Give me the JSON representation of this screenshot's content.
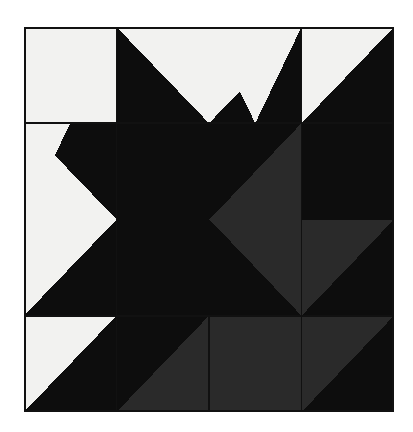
{
  "artwork": {
    "title": "Variable Star Quilt Block",
    "medium": "pieced fabric quilt block photograph",
    "background_color": "#ffffff",
    "block": {
      "x": 24,
      "y": 27,
      "width": 370,
      "height": 385,
      "grid_columns": 4,
      "grid_rows": 4,
      "seam_line_color": "#111111",
      "seam_line_width": 1.6,
      "outer_border_color": "#111111",
      "outer_border_width": 2.2
    },
    "palette": {
      "light": "#f2f2f0",
      "dark": "#0d0d0d",
      "gray": "#2b2b2b",
      "light_name": "cream",
      "dark_name": "black",
      "gray_name": "charcoal"
    },
    "grid_lines": {
      "vertical_x": [
        24,
        102,
        246,
        394
      ],
      "horizontal_y": [
        27,
        106,
        258,
        412
      ]
    },
    "patches": [
      {
        "name": "r1c1-plain-light",
        "points": "0,0 92.5,0 92.5,96.25 0,96.25",
        "fill": "light"
      },
      {
        "name": "r1c2-geese-dark-left",
        "points": "92.5,0 185,0 138.75,96.25 92.5,96.25",
        "fill": "dark"
      },
      {
        "name": "r1c2-geese-light-center",
        "points": "92.5,0 277.5,0 185,96.25 92.5,0",
        "fill": "light"
      },
      {
        "name": "r1c2c3-geese-light-triangle",
        "points": "92.5,0 277.5,0 185,96.25",
        "fill": "light"
      },
      {
        "name": "r1c3-geese-dark-right",
        "points": "277.5,0 277.5,96.25 231.25,96.25",
        "fill": "dark"
      },
      {
        "name": "r1c2-dark-fill-left",
        "points": "92.5,0 92.5,96.25 138.75,96.25",
        "fill": "dark"
      },
      {
        "name": "r1c3-light-square-left",
        "points": "185,0 277.5,0 277.5,96.25 231.25,96.25",
        "fill": "light"
      },
      {
        "name": "r1c4-hst-light",
        "points": "277.5,0 370,0 277.5,96.25",
        "fill": "light"
      },
      {
        "name": "r1c4-hst-dark",
        "points": "370,0 370,96.25 277.5,96.25",
        "fill": "dark"
      },
      {
        "name": "r2c1-point-light-upper",
        "points": "0,96.25 46.25,96.25 0,192.5",
        "fill": "light"
      },
      {
        "name": "r2c1-point-light-lower",
        "points": "0,192.5 46.25,288.75 0,288.75",
        "fill": "light"
      },
      {
        "name": "r2c1-star-point-dark",
        "points": "0,96.25 92.5,192.5 0,288.75",
        "fill": "dark"
      },
      {
        "name": "r2c1-dark-wedge-top",
        "points": "0,96.25 92.5,96.25 92.5,192.5",
        "fill": "dark"
      },
      {
        "name": "r2c1-dark-wedge-bottom",
        "points": "0,288.75 92.5,192.5 92.5,288.75",
        "fill": "dark"
      },
      {
        "name": "r2-center-dark-block",
        "points": "92.5,96.25 277.5,96.25 277.5,288.75 92.5,288.75",
        "fill": "dark"
      },
      {
        "name": "r2c3-gray-point-left",
        "points": "277.5,96.25 277.5,288.75 185.5,192.5",
        "fill": "gray"
      },
      {
        "name": "r2c4-dark-upper",
        "points": "277.5,96.25 370,96.25 370,192.5 277.5,192.5",
        "fill": "dark"
      },
      {
        "name": "r2c4-gray-hst",
        "points": "277.5,192.5 370,192.5 277.5,288.75",
        "fill": "gray"
      },
      {
        "name": "r2c4-dark-hst",
        "points": "370,192.5 370,288.75 277.5,288.75",
        "fill": "dark"
      },
      {
        "name": "r3c1-plain-light",
        "points": "0,288.75 92.5,288.75 92.5,385 0,385",
        "fill": "light"
      },
      {
        "name": "r3c1-hst-dark-corner",
        "points": "92.5,288.75 92.5,385 0,385",
        "fill": "dark"
      },
      {
        "name": "r3c2-geese-gray-up",
        "points": "92.5,385 185,288.75 277.5,385",
        "fill": "gray"
      },
      {
        "name": "r3c2-dark-left",
        "points": "92.5,288.75 185,288.75 92.5,385",
        "fill": "dark"
      },
      {
        "name": "r3c2-geese-dark-bg-left",
        "points": "92.5,288.75 185,385 92.5,385",
        "fill": "dark"
      },
      {
        "name": "r3c3-geese-gray-square",
        "points": "185,288.75 277.5,288.75 277.5,385 185,385",
        "fill": "gray"
      },
      {
        "name": "r3c4-gray-point",
        "points": "277.5,288.75 370,288.75 277.5,385",
        "fill": "gray"
      },
      {
        "name": "r3c4-dark-point",
        "points": "370,288.75 370,385 277.5,385",
        "fill": "dark"
      },
      {
        "name": "r4c2-dark-block",
        "points": "92.5,385 277.5,385 277.5,481 92.5,481",
        "fill": "dark"
      }
    ]
  }
}
